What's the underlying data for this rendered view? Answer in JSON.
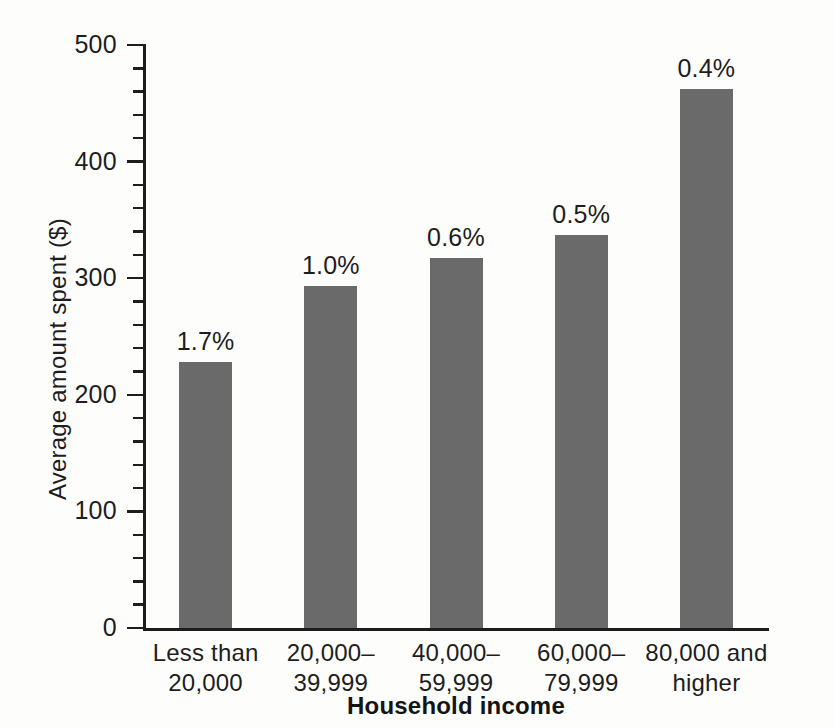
{
  "chart_data": {
    "type": "bar",
    "title": "",
    "xlabel": "Household income",
    "ylabel": "Average amount spent ($)",
    "categories": [
      "Less than\n20,000",
      "20,000–\n39,999",
      "40,000–\n59,999",
      "60,000–\n79,999",
      "80,000 and\nhigher"
    ],
    "values": [
      228,
      293,
      317,
      337,
      462
    ],
    "point_labels": [
      "1.7%",
      "1.0%",
      "0.6%",
      "0.5%",
      "0.4%"
    ],
    "ylim": [
      0,
      500
    ],
    "y_major_ticks": [
      0,
      100,
      200,
      300,
      400,
      500
    ],
    "y_tick_labels": [
      "0",
      "100",
      "200",
      "300",
      "400",
      "500"
    ],
    "y_minor_tick_step": 20,
    "grid": false,
    "legend": null,
    "bar_color": "#6a6a6a",
    "axis_color": "#1d1d1d",
    "background_color": "#fdfdfc"
  },
  "axis": {
    "y_title": "Average amount spent ($)",
    "x_title": "Household income"
  },
  "ticks": {
    "y": [
      {
        "label": "500",
        "value": 500
      },
      {
        "label": "400",
        "value": 400
      },
      {
        "label": "300",
        "value": 300
      },
      {
        "label": "200",
        "value": 200
      },
      {
        "label": "100",
        "value": 100
      },
      {
        "label": "0",
        "value": 0
      }
    ]
  },
  "bars": [
    {
      "category_line1": "Less than",
      "category_line2": "20,000",
      "value": 228,
      "label": "1.7%"
    },
    {
      "category_line1": "20,000–",
      "category_line2": "39,999",
      "value": 293,
      "label": "1.0%"
    },
    {
      "category_line1": "40,000–",
      "category_line2": "59,999",
      "value": 317,
      "label": "0.6%"
    },
    {
      "category_line1": "60,000–",
      "category_line2": "79,999",
      "value": 337,
      "label": "0.5%"
    },
    {
      "category_line1": "80,000 and",
      "category_line2": "higher",
      "value": 462,
      "label": "0.4%"
    }
  ]
}
